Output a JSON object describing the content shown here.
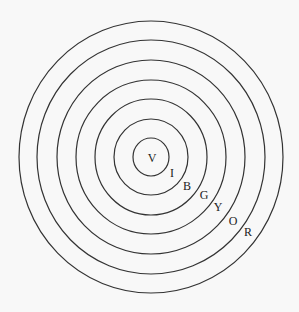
{
  "diagram": {
    "title": "",
    "center": {
      "x": 151,
      "y": 157
    },
    "rings": [
      {
        "name": "violet",
        "rx": 18,
        "ry": 19
      },
      {
        "name": "indigo",
        "rx": 37,
        "ry": 38
      },
      {
        "name": "blue",
        "rx": 56,
        "ry": 58
      },
      {
        "name": "green",
        "rx": 75,
        "ry": 77
      },
      {
        "name": "yellow",
        "rx": 94,
        "ry": 97
      },
      {
        "name": "orange",
        "rx": 114,
        "ry": 117
      },
      {
        "name": "red",
        "rx": 132,
        "ry": 136
      }
    ],
    "labels": [
      {
        "text": "V",
        "x": 152,
        "y": 159
      },
      {
        "text": "I",
        "x": 172,
        "y": 174
      },
      {
        "text": "B",
        "x": 187,
        "y": 187
      },
      {
        "text": "G",
        "x": 204,
        "y": 196
      },
      {
        "text": "Y",
        "x": 218,
        "y": 208
      },
      {
        "text": "O",
        "x": 233,
        "y": 222
      },
      {
        "text": "R",
        "x": 248,
        "y": 233
      }
    ],
    "stroke_color": "#333333",
    "background_color": "#f8f8f8"
  }
}
